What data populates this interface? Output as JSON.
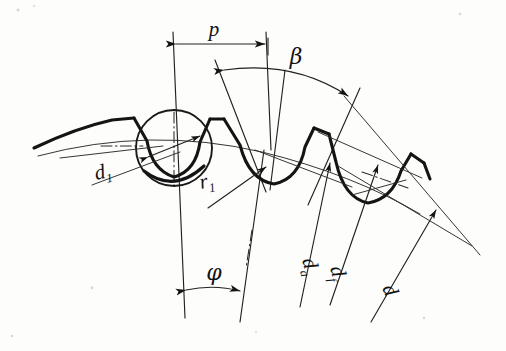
{
  "figure": {
    "kind": "engineering-line-drawing",
    "background_color": "#fdfdfb",
    "ink_color": "#141414",
    "width": 506,
    "height": 351
  },
  "labels": {
    "pitch": {
      "text": "p",
      "kind": "linear-dimension",
      "meaning": "pitch"
    },
    "helix_angle": {
      "text": "β",
      "kind": "angular-dimension",
      "meaning": "helix angle"
    },
    "pitch_angle": {
      "text": "φ",
      "kind": "angular-dimension",
      "meaning": "pitch angle"
    },
    "ball_diameter": {
      "base": "d",
      "sub": "1",
      "kind": "diameter-leader",
      "meaning": "measuring ball diameter"
    },
    "root_radius": {
      "base": "r",
      "sub": "1",
      "kind": "radius-leader",
      "meaning": "root fillet radius"
    },
    "tip_diameter": {
      "base": "d",
      "sub": "a",
      "kind": "diameter-leader",
      "meaning": "tip diameter"
    },
    "root_diameter": {
      "base": "d",
      "sub": "f",
      "kind": "diameter-leader",
      "meaning": "root diameter"
    },
    "reference_diameter": {
      "base": "d",
      "sub": "",
      "kind": "diameter-leader",
      "meaning": "reference diameter"
    }
  },
  "elements": {
    "tooth_profile": "curved rack/sprocket tooth flank outline",
    "measuring_ball": "circle seated in first tooth space",
    "pitch_arc": "thin arc through tooth flanks",
    "centerline": "dash-dot axis line",
    "radial_lines": "converging radial construction lines"
  }
}
